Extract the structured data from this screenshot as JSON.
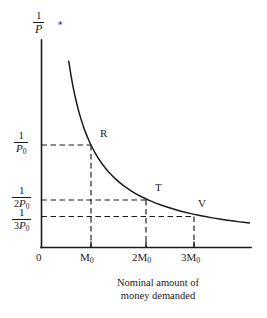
{
  "figure": {
    "name": "money-demand-rectangular-hyperbola",
    "background_color": "#ffffff",
    "ink_color": "#1a1a1a"
  },
  "axes": {
    "y_title": {
      "numerator": "1",
      "denominator": "P"
    },
    "x_title_line1": "Nominal amount of",
    "x_title_line2": "money demanded",
    "origin_label": "0"
  },
  "y_ticks": [
    {
      "numerator": "1",
      "coefficient": "",
      "denom_symbol": "P",
      "denom_subscript": "0",
      "label": "1/P0"
    },
    {
      "numerator": "1",
      "coefficient": "2",
      "denom_symbol": "P",
      "denom_subscript": "0",
      "label": "1/2P0"
    },
    {
      "numerator": "1",
      "coefficient": "3",
      "denom_symbol": "P",
      "denom_subscript": "0",
      "label": "1/3P0"
    }
  ],
  "x_ticks": [
    {
      "coefficient": "",
      "symbol": "M",
      "subscript": "0",
      "label": "M0"
    },
    {
      "coefficient": "2",
      "symbol": "M",
      "subscript": "0",
      "label": "2M0"
    },
    {
      "coefficient": "3",
      "symbol": "M",
      "subscript": "0",
      "label": "3M0"
    }
  ],
  "points": [
    {
      "label": "R",
      "x_label": "M0",
      "y_label": "1/P0",
      "x_value": 1,
      "y_value": 1
    },
    {
      "label": "T",
      "x_label": "2M0",
      "y_label": "1/2P0",
      "x_value": 2,
      "y_value": 0.5
    },
    {
      "label": "V",
      "x_label": "3M0",
      "y_label": "1/3P0",
      "x_value": 3,
      "y_value": 0.3333
    }
  ],
  "marks": {
    "top_asterisk": "∗"
  },
  "chart_data": {
    "type": "line",
    "title": "",
    "subtitle": "",
    "xlabel": "Nominal amount of money demanded",
    "ylabel": "1/P",
    "curve_name": "rectangular hyperbola (unit elastic money demand)",
    "curve_equation": "y = 1/x",
    "x": [
      0.55,
      0.6,
      0.65,
      0.7,
      0.75,
      0.8,
      0.85,
      0.9,
      0.95,
      1.0,
      1.1,
      1.2,
      1.3,
      1.4,
      1.5,
      1.6,
      1.7,
      1.8,
      1.9,
      2.0,
      2.2,
      2.4,
      2.6,
      2.8,
      3.0,
      3.2,
      3.4,
      3.6,
      3.8,
      4.0,
      4.2
    ],
    "y": [
      1.818,
      1.667,
      1.538,
      1.429,
      1.333,
      1.25,
      1.176,
      1.111,
      1.053,
      1.0,
      0.909,
      0.833,
      0.769,
      0.714,
      0.667,
      0.625,
      0.588,
      0.556,
      0.526,
      0.5,
      0.455,
      0.417,
      0.385,
      0.357,
      0.333,
      0.313,
      0.294,
      0.278,
      0.263,
      0.25,
      0.238
    ],
    "x_tick_values": [
      0,
      1,
      2,
      3
    ],
    "x_tick_labels": [
      "0",
      "M0",
      "2M0",
      "3M0"
    ],
    "y_tick_values": [
      1,
      0.5,
      0.3333
    ],
    "y_tick_labels": [
      "1/P0",
      "1/2P0",
      "1/3P0"
    ],
    "xlim": [
      0,
      4.3
    ],
    "ylim": [
      0,
      2.0
    ],
    "grid": false,
    "legend": "none",
    "annotations": [
      {
        "text": "R",
        "x": 1,
        "y": 1
      },
      {
        "text": "T",
        "x": 2,
        "y": 0.5
      },
      {
        "text": "V",
        "x": 3,
        "y": 0.3333
      }
    ],
    "guide_lines": "dashed drop-lines from each labeled point to both axes"
  }
}
